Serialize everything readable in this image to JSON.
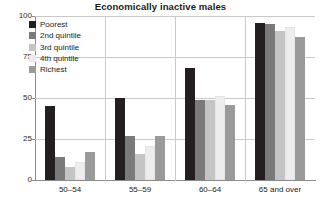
{
  "chart_data": {
    "type": "bar",
    "title": "Economically inactive males",
    "xlabel": "",
    "ylabel": "",
    "ylim": [
      0,
      100
    ],
    "yticks": [
      0,
      25,
      50,
      75,
      100
    ],
    "grid": true,
    "legend_position": "top-left",
    "categories": [
      "50–54",
      "55–59",
      "60–64",
      "65 and over"
    ],
    "series": [
      {
        "name": "Poorest",
        "color": "#231f20",
        "values": [
          45,
          50,
          68,
          96
        ]
      },
      {
        "name": "2nd quintile",
        "color": "#7a7a7a",
        "values": [
          14,
          27,
          49,
          95
        ]
      },
      {
        "name": "3rd quintile",
        "color": "#c4c4c4",
        "values": [
          8,
          16,
          49,
          91
        ]
      },
      {
        "name": "4th quintile",
        "color": "#ededed",
        "values": [
          11,
          21,
          51,
          93
        ]
      },
      {
        "name": "Richest",
        "color": "#9a9a9a",
        "values": [
          17,
          27,
          46,
          87
        ]
      }
    ]
  },
  "axis": {
    "y_tick_labels": [
      "0",
      "25",
      "50",
      "75",
      "100"
    ]
  }
}
